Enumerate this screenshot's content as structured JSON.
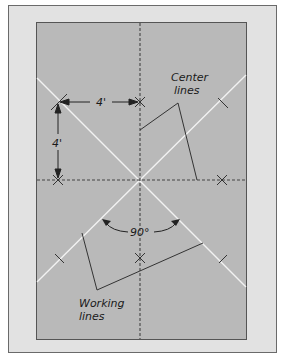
{
  "diagram": {
    "labels": {
      "center_lines_1": "Center",
      "center_lines_2": "lines",
      "working_lines_1": "Working",
      "working_lines_2": "lines",
      "horizontal_dim": "4'",
      "vertical_dim": "4'",
      "angle": "90°"
    },
    "colors": {
      "frame_bg": "#e2e2e2",
      "frame_border": "#6a6a6a",
      "panel_bg": "#b9b9b9",
      "panel_border": "#555555",
      "working_line": "#f2f2f2",
      "center_line": "#444444",
      "ink": "#222222"
    },
    "geometry": {
      "center": [
        140,
        180
      ],
      "marks": {
        "top_x": [
          140,
          102
        ],
        "left_x": [
          58,
          180
        ],
        "right_x": [
          222,
          180
        ],
        "bottom_x": [
          140,
          258
        ],
        "upper_left_slash": [
          58,
          102
        ]
      }
    }
  }
}
